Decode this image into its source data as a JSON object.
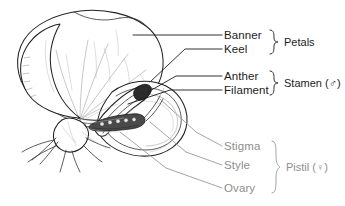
{
  "colors": {
    "label_dark": "#1c1c1c",
    "label_gray": "#8e8e8e",
    "leader_dark": "#1c1c1c",
    "leader_gray": "#9a9a9a",
    "background": "#ffffff",
    "outline": "#222222",
    "ovary": "#4a4a4a"
  },
  "groups": [
    {
      "id": "petals",
      "group_label": "Petals",
      "tone": "dark",
      "parts": [
        {
          "id": "banner",
          "label": "Banner"
        },
        {
          "id": "keel",
          "label": "Keel"
        }
      ]
    },
    {
      "id": "stamen",
      "group_label": "Stamen (♂)",
      "tone": "dark",
      "parts": [
        {
          "id": "anther",
          "label": "Anther"
        },
        {
          "id": "filament",
          "label": "Filament"
        }
      ]
    },
    {
      "id": "pistil",
      "group_label": "Pistil (♀)",
      "tone": "gray",
      "parts": [
        {
          "id": "stigma",
          "label": "Stigma"
        },
        {
          "id": "style",
          "label": "Style"
        },
        {
          "id": "ovary",
          "label": "Ovary"
        }
      ]
    }
  ],
  "labels": {
    "banner": "Banner",
    "keel": "Keel",
    "petals": "Petals",
    "anther": "Anther",
    "filament": "Filament",
    "stamen": "Stamen (♂)",
    "stigma": "Stigma",
    "style": "Style",
    "ovary": "Ovary",
    "pistil": "Pistil (♀)"
  }
}
